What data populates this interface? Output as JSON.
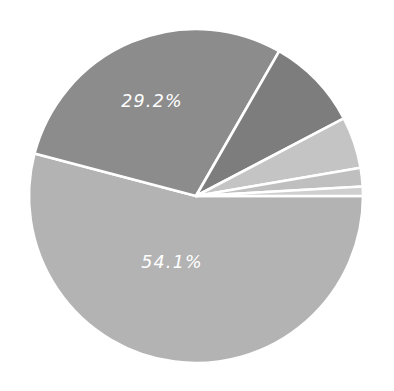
{
  "chart_data": {
    "type": "pie",
    "title": "",
    "subtitle": "",
    "xlabel": "",
    "ylabel": "",
    "grid": false,
    "legend_position": "none",
    "center": {
      "x": 196,
      "y": 196
    },
    "radius": 167,
    "start_angle_deg": 0,
    "direction": "clockwise",
    "label_text_color": "#ffffff",
    "slice_border_color": "#ffffff",
    "background_color": "#ffffff",
    "categories": [
      "Slice 1",
      "Slice 2",
      "Slice 3",
      "Slice 4",
      "Slice 5",
      "Slice 6"
    ],
    "values": [
      54.1,
      29.2,
      9.0,
      5.0,
      1.8,
      0.9
    ],
    "labels_shown": [
      "54.1%",
      "29.2%",
      "",
      "",
      "",
      ""
    ],
    "colors": [
      "#b3b3b3",
      "#8c8c8c",
      "#7d7d7d",
      "#c4c4c4",
      "#bfbfbf",
      "#cfcfcf"
    ],
    "slices": [
      {
        "name": "Slice 1",
        "value": 54.1,
        "label": "54.1%",
        "color": "#b3b3b3",
        "start_deg": 0,
        "end_deg": 194.76,
        "label_x": 172,
        "label_y": 263,
        "show_label": true
      },
      {
        "name": "Slice 2",
        "value": 29.2,
        "label": "29.2%",
        "color": "#8c8c8c",
        "start_deg": 194.76,
        "end_deg": 299.88,
        "label_x": 152,
        "label_y": 102,
        "show_label": true
      },
      {
        "name": "Slice 3",
        "value": 9.0,
        "label": "9.0%",
        "color": "#7d7d7d",
        "start_deg": 299.88,
        "end_deg": 332.28,
        "label_x": 0,
        "label_y": 0,
        "show_label": false
      },
      {
        "name": "Slice 4",
        "value": 5.0,
        "label": "5.0%",
        "color": "#c4c4c4",
        "start_deg": 332.28,
        "end_deg": 350.28,
        "label_x": 0,
        "label_y": 0,
        "show_label": false
      },
      {
        "name": "Slice 5",
        "value": 1.8,
        "label": "1.8%",
        "color": "#bfbfbf",
        "start_deg": 350.28,
        "end_deg": 356.76,
        "label_x": 0,
        "label_y": 0,
        "show_label": false
      },
      {
        "name": "Slice 6",
        "value": 0.9,
        "label": "0.9%",
        "color": "#cfcfcf",
        "start_deg": 356.76,
        "end_deg": 360,
        "label_x": 0,
        "label_y": 0,
        "show_label": false
      }
    ]
  }
}
